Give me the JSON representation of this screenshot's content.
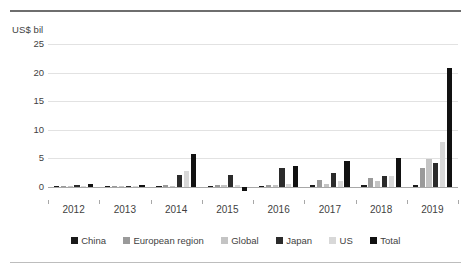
{
  "axis": {
    "unit_label": "US$ bil",
    "y_ticks": [
      "25",
      "20",
      "15",
      "10",
      "5",
      "0"
    ],
    "x_ticks": [
      "2012",
      "2013",
      "2014",
      "2015",
      "2016",
      "2017",
      "2018",
      "2019"
    ]
  },
  "legend": {
    "items": [
      {
        "label": "China",
        "color": "#1a1a1a"
      },
      {
        "label": "European region",
        "color": "#9a9a9a"
      },
      {
        "label": "Global",
        "color": "#c4c4c4"
      },
      {
        "label": "Japan",
        "color": "#2b2b2b"
      },
      {
        "label": "US",
        "color": "#d8d8d8"
      },
      {
        "label": "Total",
        "color": "#111111"
      }
    ]
  },
  "chart_data": {
    "type": "bar",
    "title": "",
    "xlabel": "",
    "ylabel": "US$ bil",
    "ylim": [
      -2,
      25
    ],
    "grid": true,
    "legend_position": "bottom",
    "categories": [
      "2012",
      "2013",
      "2014",
      "2015",
      "2016",
      "2017",
      "2018",
      "2019"
    ],
    "series": [
      {
        "name": "China",
        "color": "#1a1a1a",
        "values": [
          0.05,
          0.05,
          0.1,
          0.1,
          0.15,
          0.2,
          0.25,
          0.3
        ]
      },
      {
        "name": "European region",
        "color": "#9a9a9a",
        "values": [
          0.1,
          0.1,
          0.25,
          0.3,
          0.35,
          1.1,
          1.55,
          3.3
        ]
      },
      {
        "name": "Global",
        "color": "#c4c4c4",
        "values": [
          0.05,
          0.05,
          0.15,
          0.2,
          0.25,
          0.45,
          1.05,
          4.8
        ]
      },
      {
        "name": "Japan",
        "color": "#2b2b2b",
        "values": [
          0.3,
          0.1,
          1.95,
          2.1,
          3.2,
          2.45,
          1.9,
          4.05
        ]
      },
      {
        "name": "US",
        "color": "#d8d8d8",
        "values": [
          0.05,
          0.05,
          2.75,
          0.3,
          0.4,
          1.05,
          1.8,
          7.9
        ]
      },
      {
        "name": "Total",
        "color": "#111111",
        "values": [
          0.4,
          0.25,
          5.7,
          -0.7,
          3.6,
          4.5,
          5.1,
          20.75
        ]
      }
    ]
  }
}
